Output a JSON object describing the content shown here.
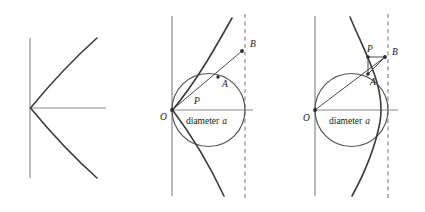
{
  "figure": {
    "title": "",
    "width": 425,
    "height": 212,
    "background": "#ffffff",
    "stroke_curve": "#3b3b3b",
    "stroke_axis": "#8a8a8a",
    "stroke_circle": "#555555",
    "stroke_ray": "#4a4a4a",
    "label_color": "#1a1a1a"
  },
  "panels": [
    {
      "id": "panel-1",
      "name": "parabola-only",
      "labels": [],
      "axes": {
        "vertical": {
          "x": 30,
          "y1": 38,
          "y2": 178
        },
        "horizontal": {
          "y": 108,
          "x1": 30,
          "x2": 106
        }
      },
      "origin": {
        "x": 30,
        "y": 108
      },
      "curve": {
        "type": "parabola",
        "opens": "right",
        "vertex": {
          "x": 30,
          "y": 108
        },
        "upper_end": {
          "x": 97,
          "y": 38
        },
        "lower_end": {
          "x": 97,
          "y": 178
        }
      }
    },
    {
      "id": "panel-2",
      "name": "parabola-with-circle-p-inside",
      "axes": {
        "vertical": {
          "x": 172,
          "y1": 16,
          "y2": 196
        },
        "horizontal": {
          "y": 110,
          "x1": 172,
          "x2": 253
        }
      },
      "directrix": {
        "x": 245,
        "y1": 14,
        "y2": 198,
        "style": "dashed"
      },
      "origin": {
        "x": 172,
        "y": 110
      },
      "circle": {
        "cx": 208.5,
        "cy": 110,
        "r": 36.5
      },
      "points": {
        "O": {
          "x": 172,
          "y": 110,
          "label": "O",
          "label_x": 160,
          "label_y": 120
        },
        "P": {
          "x": 197,
          "y": 92,
          "label": "P",
          "label_x": 194,
          "label_y": 104
        },
        "A": {
          "x": 218,
          "y": 77,
          "label": "A",
          "label_x": 222,
          "label_y": 87
        },
        "B": {
          "x": 242,
          "y": 51,
          "label": "B",
          "label_x": 250,
          "label_y": 47
        }
      },
      "annotation": {
        "text_plain": "diameter",
        "text_italic": "a",
        "x": 186,
        "y": 124
      },
      "curve": {
        "type": "parabola",
        "opens": "up-right",
        "vertex": {
          "x": 172,
          "y": 110
        },
        "upper_end": {
          "x": 232,
          "y": 18
        },
        "lower_end": {
          "x": 224,
          "y": 196
        }
      }
    },
    {
      "id": "panel-3",
      "name": "parabola-with-circle-p-outside",
      "axes": {
        "vertical": {
          "x": 315,
          "y1": 16,
          "y2": 196
        },
        "horizontal": {
          "y": 110,
          "x1": 315,
          "x2": 398
        },
        "note": ""
      },
      "directrix": {
        "x": 388,
        "y1": 14,
        "y2": 198,
        "style": "dashed"
      },
      "origin": {
        "x": 315,
        "y": 110
      },
      "circle": {
        "cx": 351.5,
        "cy": 110,
        "r": 36.5
      },
      "points": {
        "O": {
          "x": 315,
          "y": 110,
          "label": "O",
          "label_x": 303,
          "label_y": 121
        },
        "P": {
          "x": 368,
          "y": 57,
          "label": "P",
          "label_x": 367,
          "label_y": 52
        },
        "A": {
          "x": 368,
          "y": 74,
          "label": "A",
          "label_x": 370,
          "label_y": 85
        },
        "B": {
          "x": 385,
          "y": 57,
          "label": "B",
          "label_x": 392,
          "label_y": 55
        }
      },
      "annotation": {
        "text_plain": "diameter",
        "text_italic": "a",
        "x": 329,
        "y": 124
      },
      "curve": {
        "type": "parabola",
        "opens": "down-right",
        "apex_upper_end": {
          "x": 350,
          "y": 17
        },
        "lower_end": {
          "x": 352,
          "y": 196
        }
      }
    }
  ]
}
